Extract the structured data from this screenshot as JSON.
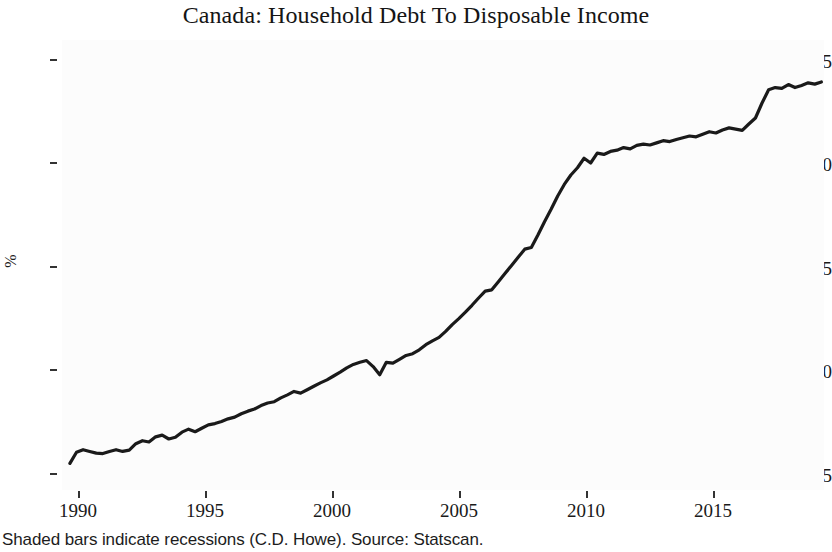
{
  "chart_data": {
    "type": "line",
    "title": "Canada: Household Debt To Disposable Income",
    "caption": "Shaded bars indicate recessions (C.D. Howe). Source: Statscan.",
    "xlabel": "",
    "ylabel": "%",
    "xlim": [
      1989.7,
      2018.6
    ],
    "ylim": [
      73.0,
      178.0
    ],
    "xticks": [
      1990,
      1995,
      2000,
      2005,
      2010,
      2015
    ],
    "xtick_labels": [
      "1990",
      "1995",
      "2000",
      "2005",
      "2010",
      "2015"
    ],
    "yticks": [
      75,
      100,
      125,
      150,
      175
    ],
    "ytick_labels": [
      "75",
      "100",
      "125",
      "150",
      "175"
    ],
    "grid": false,
    "legend": "none",
    "line_color": "#1a1a1a",
    "line_width": 3.2,
    "panel_background": "#fcfcfc",
    "series": [
      {
        "name": "Household debt to disposable income",
        "x": [
          1990.0,
          1990.25,
          1990.5,
          1990.75,
          1991.0,
          1991.25,
          1991.5,
          1991.75,
          1992.0,
          1992.25,
          1992.5,
          1992.75,
          1993.0,
          1993.25,
          1993.5,
          1993.75,
          1994.0,
          1994.25,
          1994.5,
          1994.75,
          1995.0,
          1995.25,
          1995.5,
          1995.75,
          1996.0,
          1996.25,
          1996.5,
          1996.75,
          1997.0,
          1997.25,
          1997.5,
          1997.75,
          1998.0,
          1998.25,
          1998.5,
          1998.75,
          1999.0,
          1999.25,
          1999.5,
          1999.75,
          2000.0,
          2000.25,
          2000.5,
          2000.75,
          2001.0,
          2001.25,
          2001.5,
          2001.75,
          2002.0,
          2002.25,
          2002.5,
          2002.75,
          2003.0,
          2003.25,
          2003.5,
          2003.75,
          2004.0,
          2004.25,
          2004.5,
          2004.75,
          2005.0,
          2005.25,
          2005.5,
          2005.75,
          2006.0,
          2006.25,
          2006.5,
          2006.75,
          2007.0,
          2007.25,
          2007.5,
          2007.75,
          2008.0,
          2008.25,
          2008.5,
          2008.75,
          2009.0,
          2009.25,
          2009.5,
          2009.75,
          2010.0,
          2010.25,
          2010.5,
          2010.75,
          2011.0,
          2011.25,
          2011.5,
          2011.75,
          2012.0,
          2012.25,
          2012.5,
          2012.75,
          2013.0,
          2013.25,
          2013.5,
          2013.75,
          2014.0,
          2014.25,
          2014.5,
          2014.75,
          2015.0,
          2015.25,
          2015.5,
          2015.75,
          2016.0,
          2016.25,
          2016.5,
          2016.75,
          2017.0,
          2017.25,
          2017.5,
          2017.75,
          2018.0,
          2018.25,
          2018.5
        ],
        "values": [
          79.2,
          81.8,
          82.4,
          82.0,
          81.6,
          81.5,
          82.0,
          82.4,
          82.0,
          82.3,
          83.8,
          84.5,
          84.2,
          85.4,
          85.8,
          84.9,
          85.3,
          86.5,
          87.2,
          86.6,
          87.4,
          88.2,
          88.5,
          89.0,
          89.6,
          90.0,
          90.8,
          91.4,
          91.9,
          92.7,
          93.3,
          93.6,
          94.5,
          95.2,
          96.0,
          95.6,
          96.4,
          97.2,
          98.0,
          98.7,
          99.6,
          100.5,
          101.5,
          102.3,
          102.8,
          103.2,
          101.8,
          99.9,
          102.8,
          102.6,
          103.5,
          104.4,
          104.8,
          105.7,
          106.9,
          107.8,
          108.6,
          110.0,
          111.6,
          113.0,
          114.5,
          116.1,
          117.8,
          119.4,
          119.7,
          121.6,
          123.5,
          125.4,
          127.3,
          129.2,
          129.6,
          132.5,
          135.6,
          138.5,
          141.6,
          144.3,
          146.5,
          148.2,
          150.4,
          149.3,
          151.6,
          151.3,
          152.0,
          152.3,
          152.9,
          152.6,
          153.4,
          153.7,
          153.5,
          154.0,
          154.5,
          154.3,
          154.8,
          155.2,
          155.6,
          155.4,
          156.0,
          156.6,
          156.3,
          157.0,
          157.5,
          157.2,
          156.9,
          158.4,
          159.8,
          163.3,
          166.4,
          166.9,
          166.7,
          167.6,
          166.9,
          167.4,
          168.0,
          167.7,
          168.2
        ]
      }
    ],
    "annotations": []
  },
  "axis": {
    "y_title": "%",
    "y_labels": [
      "175",
      "150",
      "125",
      "100",
      "75"
    ],
    "x_labels": [
      "1990",
      "1995",
      "2000",
      "2005",
      "2010",
      "2015"
    ]
  }
}
